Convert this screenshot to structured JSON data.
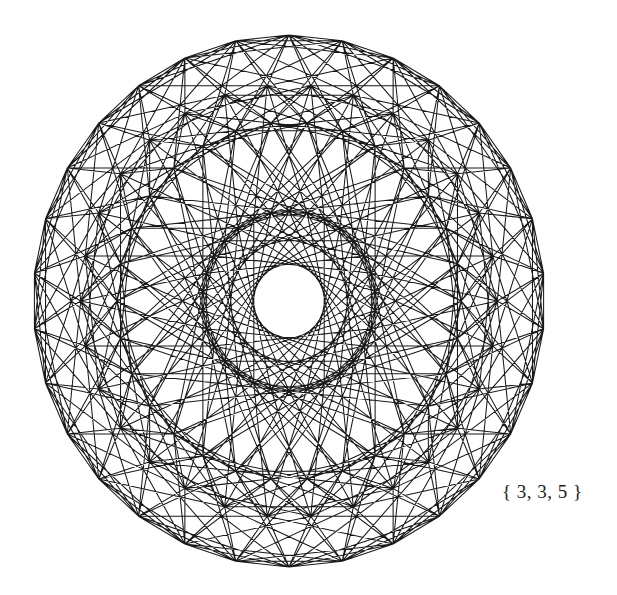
{
  "figure": {
    "schlafli_symbol": "{ 3, 3, 5 }",
    "vertices": 120,
    "edges": 720,
    "symmetry": "30-fold (H4 Coxeter plane)",
    "line_color": "#1a1a1a",
    "background": "#ffffff",
    "center": [
      289,
      301
    ],
    "outer_radius_x": 256,
    "outer_radius_y": 266
  }
}
